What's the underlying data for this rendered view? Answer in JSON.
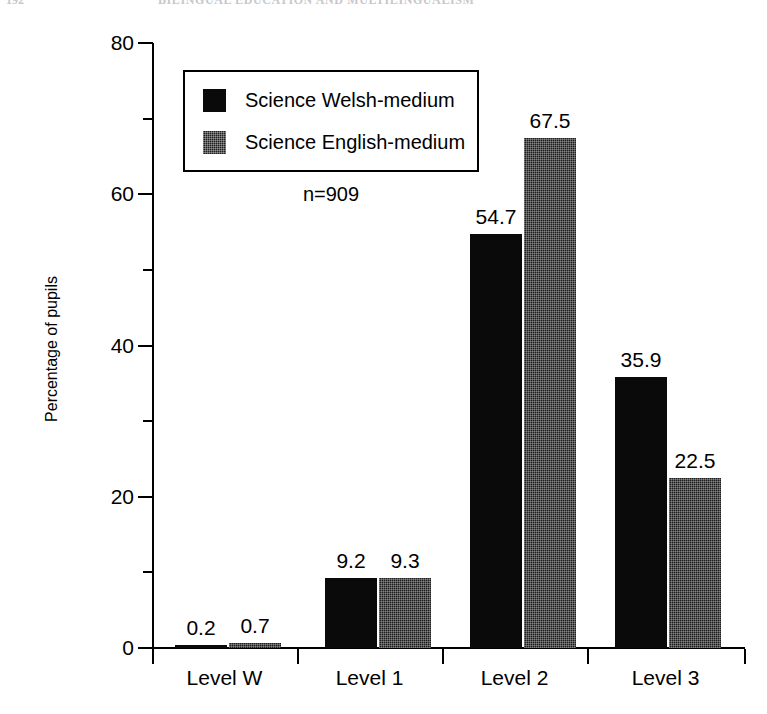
{
  "page_header": {
    "folio": "192",
    "running_title": "BILINGUAL EDUCATION AND MULTILINGUALISM"
  },
  "chart_data": {
    "type": "bar",
    "title": "",
    "subtitle": "",
    "xlabel": "",
    "ylabel": "Percentage of pupils",
    "categories": [
      "Level W",
      "Level 1",
      "Level 2",
      "Level 3"
    ],
    "series": [
      {
        "name": "Science Welsh-medium",
        "swatch": "solid",
        "color": "#0a0a0a",
        "values": [
          0.2,
          9.2,
          54.7,
          35.9
        ],
        "value_labels": [
          "0.2",
          "9.2",
          "54.7",
          "35.9"
        ]
      },
      {
        "name": "Science English-medium",
        "swatch": "hatched",
        "color": "#1d1d1d",
        "values": [
          0.7,
          9.3,
          67.5,
          22.5
        ],
        "value_labels": [
          "0.7",
          "9.3",
          "67.5",
          "22.5"
        ]
      }
    ],
    "ylim": [
      0,
      80
    ],
    "yticks_major": [
      0,
      20,
      40,
      60,
      80
    ],
    "ytick_labels": [
      "0",
      "20",
      "40",
      "60",
      "80"
    ],
    "yticks_minor": [
      10,
      30,
      50,
      70
    ],
    "grid": false,
    "legend_position": "upper-left-inside",
    "annotations": [
      {
        "name": "sample-size",
        "text": "n=909"
      }
    ]
  },
  "legend": {
    "items": [
      {
        "label": "Science Welsh-medium"
      },
      {
        "label": "Science English-medium"
      }
    ]
  },
  "annotation": {
    "sample_size": "n=909"
  }
}
